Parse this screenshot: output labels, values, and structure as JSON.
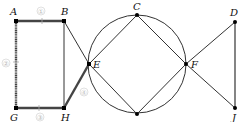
{
  "diagram": {
    "type": "graph",
    "nodes": [
      {
        "id": "A",
        "label": "A",
        "x": 16,
        "y": 21
      },
      {
        "id": "B",
        "label": "B",
        "x": 64,
        "y": 21
      },
      {
        "id": "G",
        "label": "G",
        "x": 16,
        "y": 108
      },
      {
        "id": "H",
        "label": "H",
        "x": 64,
        "y": 108
      },
      {
        "id": "E",
        "label": "E",
        "x": 89,
        "y": 64
      },
      {
        "id": "C",
        "label": "C",
        "x": 137,
        "y": 15
      },
      {
        "id": "I",
        "label": "",
        "x": 137,
        "y": 114
      },
      {
        "id": "F",
        "label": "F",
        "x": 186,
        "y": 64
      },
      {
        "id": "D",
        "label": "D",
        "x": 235,
        "y": 22
      },
      {
        "id": "J",
        "label": "J",
        "x": 235,
        "y": 108
      }
    ],
    "circle": {
      "cx": 137,
      "cy": 64,
      "r": 49
    },
    "edge_numbers": [
      {
        "edge": "A-B",
        "label": "①"
      },
      {
        "edge": "A-G",
        "label": "②"
      },
      {
        "edge": "G-H",
        "label": "③"
      },
      {
        "edge": "H-E",
        "label": "④"
      }
    ],
    "highlighted_path": [
      "B",
      "A",
      "G",
      "H",
      "E"
    ],
    "colors": {
      "line": "#333333",
      "highlight": "#555555",
      "node": "#000000",
      "edge_label": "#bbbbbb"
    }
  }
}
